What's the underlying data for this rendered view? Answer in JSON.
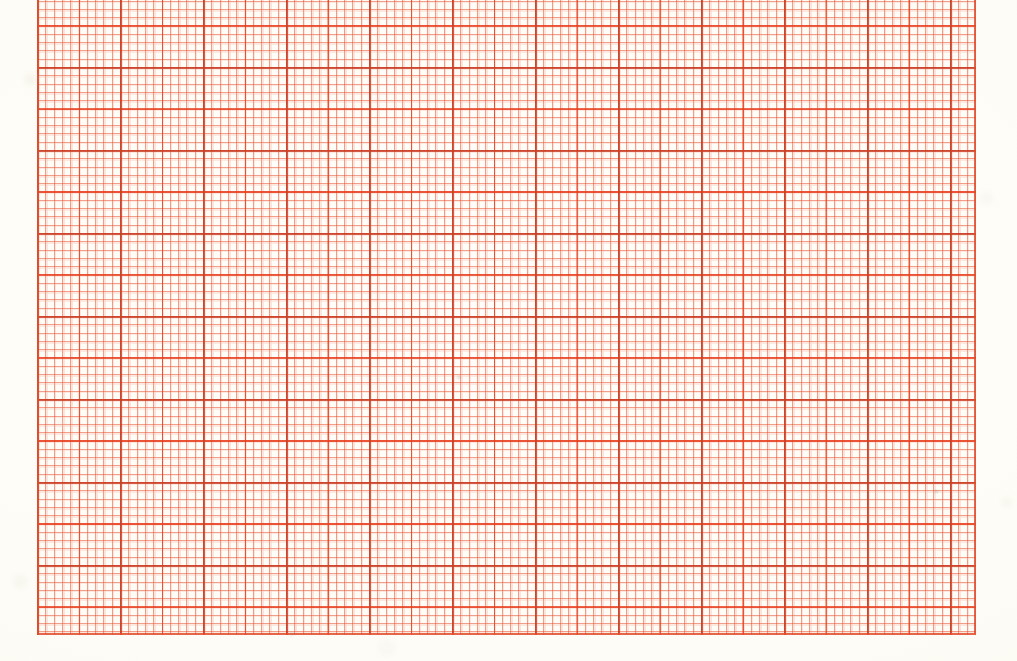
{
  "document": {
    "type": "scanned-graph-paper",
    "title": "Graph paper sheet (scan)",
    "description": "A scanned sheet of red-orange printed graph paper. No text, labels, numbers or handwriting are present on the sheet.",
    "paper_color": "#fdfcf7",
    "grid_line_color": "#ee5c3a",
    "grid_major_line_color": "#cd4a30",
    "width_px": 1017,
    "height_px": 661
  },
  "grid": {
    "name": "printed-grid-area",
    "left_px": 37,
    "top_px": -16,
    "right_px": 976,
    "bottom_px": 635,
    "minor_cell_px": 8.3,
    "mid_cell_px": 41.5,
    "major_cell_px": 83,
    "minor_per_mid": 5,
    "minor_per_major": 10,
    "columns_minor": 113,
    "rows_minor": 78,
    "has_border_rule": true,
    "bleeds_off_top_edge": true
  },
  "margins": {
    "left_label": "left blank margin",
    "right_label": "right blank margin",
    "bottom_label": "bottom blank margin",
    "top_label": "grid runs off top edge",
    "left_px": 37,
    "right_px": 41,
    "bottom_px": 26,
    "top_px": 0
  },
  "annotations": {
    "marks": [],
    "text": [],
    "note": "Sheet is blank — grid ruling only."
  }
}
